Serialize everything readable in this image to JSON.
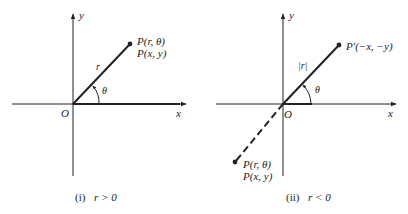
{
  "figures": [
    {
      "id": "i",
      "caption_num": "(i)",
      "caption_cond": "r > 0",
      "axis_x": "x",
      "axis_y": "y",
      "origin": "O",
      "segment_label": "r",
      "angle_label": "θ",
      "point_polar": "P(r, θ)",
      "point_cart": "P(x, y)"
    },
    {
      "id": "ii",
      "caption_num": "(ii)",
      "caption_cond": "r < 0",
      "axis_x": "x",
      "axis_y": "y",
      "origin": "O",
      "segment_label": "|r|",
      "angle_label": "θ",
      "point_prime": "P′(−x, −y)",
      "point_polar": "P(r, θ)",
      "point_cart": "P(x, y)"
    }
  ]
}
